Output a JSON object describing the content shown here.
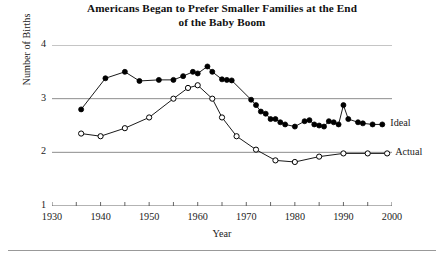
{
  "title": {
    "line1": "Americans Began to Prefer Smaller Families at the End",
    "line2": "of the Baby Boom"
  },
  "axes": {
    "xlabel": "Year",
    "ylabel": "Number of Births",
    "yticks": [
      "1",
      "2",
      "3",
      "4"
    ],
    "xticks": [
      "1930",
      "1940",
      "1950",
      "1960",
      "1970",
      "1980",
      "1990",
      "2000"
    ]
  },
  "series_labels": {
    "ideal": "Ideal",
    "actual": "Actual"
  },
  "colors": {
    "ideal": "#000000",
    "actual": "#000000",
    "gridline": "#808080",
    "axis": "#555555",
    "text": "#1a1a1a"
  },
  "chart_data": {
    "type": "line",
    "title": "Americans Began to Prefer Smaller Families at the End of the Baby Boom",
    "xlabel": "Year",
    "ylabel": "Number of Births",
    "xlim": [
      1930,
      2000
    ],
    "ylim": [
      1,
      4
    ],
    "yticks": [
      1,
      2,
      3,
      4
    ],
    "xticks": [
      1930,
      1940,
      1950,
      1960,
      1970,
      1980,
      1990,
      2000
    ],
    "minor_xticks_every": 5,
    "grid": "horizontal gridlines at y = 2, 3, 4",
    "legend": "series labeled at right end of each line",
    "series": [
      {
        "name": "Ideal",
        "marker": "filled circle",
        "points": [
          [
            1936,
            2.8
          ],
          [
            1941,
            3.38
          ],
          [
            1945,
            3.5
          ],
          [
            1948,
            3.33
          ],
          [
            1952,
            3.35
          ],
          [
            1955,
            3.35
          ],
          [
            1957,
            3.42
          ],
          [
            1959,
            3.5
          ],
          [
            1960,
            3.47
          ],
          [
            1962,
            3.6
          ],
          [
            1963,
            3.5
          ],
          [
            1965,
            3.36
          ],
          [
            1966,
            3.35
          ],
          [
            1967,
            3.34
          ],
          [
            1971,
            2.98
          ],
          [
            1972,
            2.88
          ],
          [
            1973,
            2.76
          ],
          [
            1974,
            2.72
          ],
          [
            1975,
            2.62
          ],
          [
            1976,
            2.62
          ],
          [
            1977,
            2.56
          ],
          [
            1978,
            2.52
          ],
          [
            1980,
            2.48
          ],
          [
            1982,
            2.58
          ],
          [
            1983,
            2.6
          ],
          [
            1984,
            2.52
          ],
          [
            1985,
            2.5
          ],
          [
            1986,
            2.48
          ],
          [
            1987,
            2.58
          ],
          [
            1988,
            2.56
          ],
          [
            1989,
            2.52
          ],
          [
            1990,
            2.88
          ],
          [
            1991,
            2.62
          ],
          [
            1993,
            2.56
          ],
          [
            1994,
            2.54
          ],
          [
            1996,
            2.52
          ],
          [
            1998,
            2.52
          ]
        ]
      },
      {
        "name": "Actual",
        "marker": "open circle",
        "points": [
          [
            1936,
            2.35
          ],
          [
            1940,
            2.3
          ],
          [
            1945,
            2.45
          ],
          [
            1950,
            2.65
          ],
          [
            1955,
            3.0
          ],
          [
            1958,
            3.2
          ],
          [
            1960,
            3.25
          ],
          [
            1963,
            3.0
          ],
          [
            1965,
            2.65
          ],
          [
            1968,
            2.3
          ],
          [
            1972,
            2.05
          ],
          [
            1976,
            1.85
          ],
          [
            1980,
            1.82
          ],
          [
            1985,
            1.92
          ],
          [
            1990,
            1.98
          ],
          [
            1995,
            1.98
          ],
          [
            1999,
            1.98
          ]
        ]
      }
    ]
  }
}
